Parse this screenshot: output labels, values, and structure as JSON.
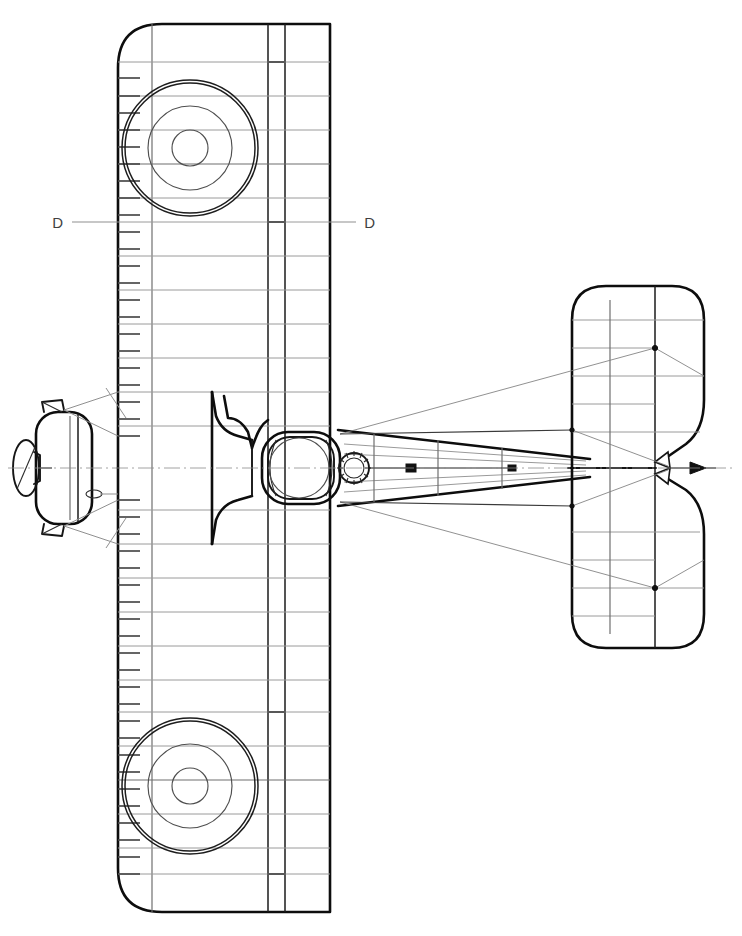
{
  "drawing": {
    "kind": "technical-line-drawing",
    "subject": "biplane-plan-view",
    "view": "top-plan",
    "background_color": "#ffffff",
    "line_color": "#0d0d0d",
    "rib_color": "#9a9a9a",
    "wire_color": "#7d7d7d",
    "width": 742,
    "height": 936
  },
  "annotations": {
    "section_cut": {
      "label_left": "D",
      "label_right": "D",
      "left_x": 58,
      "right_x": 368,
      "y": 222
    }
  },
  "wing": {
    "leading_edge_x": 118,
    "rear_spar_x": 268,
    "aileron_front_x": 285,
    "trailing_edge_x": 330,
    "top_tip_y": 24,
    "bottom_tip_y": 912,
    "corner_radius": 44,
    "rib_count_upper": 26,
    "rib_count_lower": 26,
    "tick_length": 22
  },
  "roundels": [
    {
      "name": "upper-roundel",
      "cx": 190,
      "cy": 148,
      "radii": [
        68,
        42,
        18
      ]
    },
    {
      "name": "lower-roundel",
      "cx": 190,
      "cy": 786,
      "radii": [
        68,
        42,
        18
      ]
    }
  ],
  "fuselage": {
    "nose_x": 252,
    "tail_x": 590,
    "half_width_root": 46,
    "half_width_tail": 9,
    "cockpit": {
      "cx": 299,
      "cy": 468,
      "r": 30
    },
    "cowl": {
      "x": 262,
      "y": 432,
      "w": 78,
      "h": 72,
      "r": 26
    },
    "prop_hub": {
      "cx": 354,
      "cy": 468,
      "r": 15,
      "teeth": 20
    }
  },
  "tailplane": {
    "leading_edge_x": 572,
    "hinge_x": 655,
    "trailing_edge_x": 704,
    "top_y": 286,
    "bottom_y": 648,
    "notch_depth": 48,
    "rib_count": 18
  },
  "front_view": {
    "name": "nose-front-elevation",
    "body": {
      "x": 36,
      "y": 412,
      "w": 56,
      "h": 112,
      "r": 22
    },
    "propeller": {
      "cx": 26,
      "cy": 468,
      "rx": 13,
      "ry": 28
    },
    "axle_y": 468
  }
}
